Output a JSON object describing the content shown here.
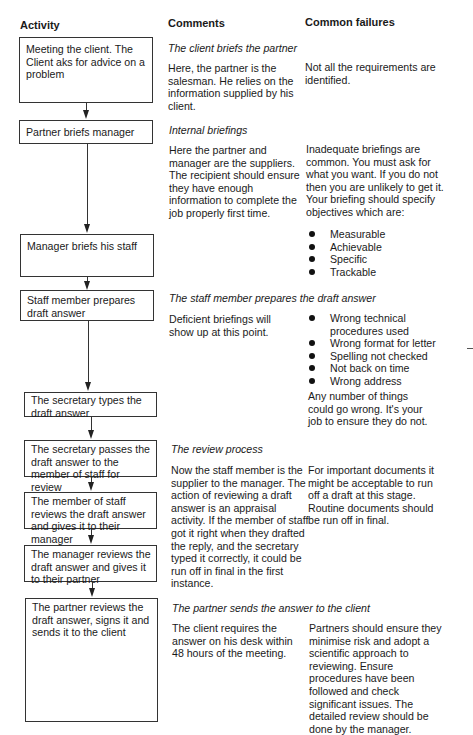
{
  "headers": {
    "activity": "Activity",
    "comments": "Comments",
    "failures": "Common failures"
  },
  "activities": [
    "Meeting the client. The Client aks for advice on a problem",
    "Partner briefs manager",
    "Manager briefs his staff",
    "Staff member prepares draft answer",
    "The secretary types the draft answer",
    "The secretary passes the draft answer to the member of staff for review",
    "The member of staff reviews the draft answer and gives it to their manager",
    "The manager reviews the draft answer and gives it to their partner",
    "The partner reviews the draft answer, signs it and sends it to the client"
  ],
  "sections": [
    {
      "title": "The client briefs the partner",
      "comment": "Here, the partner is the salesman. He relies on the information supplied by his client.",
      "failure": "Not all the requirements are identified."
    },
    {
      "title": "Internal briefings",
      "comment": "Here the partner and manager are the suppliers. The recipient should ensure they have enough information to complete the job properly first time.",
      "failure": "Inadequate briefings are common. You must ask for what you want. If you do not then you are unlikely to get it. Your briefing should specify objectives which are:",
      "failure_bullets": [
        "Measurable",
        "Achievable",
        "Specific",
        "Trackable"
      ]
    },
    {
      "title": "The staff member prepares the draft answer",
      "comment": "Deficient briefings will show up at this point.",
      "failure_bullets": [
        "Wrong technical procedures used",
        "Wrong format for letter",
        "Spelling not checked",
        "Not back on time",
        "Wrong address"
      ],
      "failure_after": "Any number of things could go wrong. It's your job to ensure they do not."
    },
    {
      "title": "The review process",
      "comment": "Now the staff member is the supplier to the manager. The action of reviewing a draft answer is an appraisal activity. If the member of staff got it right when they drafted the reply, and the secretary typed it correctly, it could be run off in final in the first instance.",
      "failure": "For important documents it might be acceptable to run off a draft at this stage. Routine documents should be run off in final."
    },
    {
      "title": "The partner sends the answer to the client",
      "comment": "The client requires the answer on his desk within 48 hours of the meeting.",
      "failure": "Partners should ensure they minimise risk and adopt a scientific approach to reviewing. Ensure procedures have been followed and check significant issues. The detailed review should be done by the manager."
    }
  ]
}
